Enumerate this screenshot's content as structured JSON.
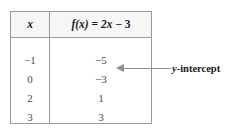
{
  "table": {
    "headers": {
      "variable": "x",
      "function_prefix": "f",
      "function_arg": "(x)",
      "function_equals": "=",
      "function_term": "2x",
      "function_minus": "−",
      "function_constant": "3",
      "function_full": "f(x) = 2x − 3"
    },
    "rows": [
      {
        "x": "−1",
        "fx": "−5"
      },
      {
        "x": "0",
        "fx": "−3"
      },
      {
        "x": "2",
        "fx": "1"
      },
      {
        "x": "3",
        "fx": "3"
      }
    ]
  },
  "annotation": {
    "label_italic": "y",
    "label_rest": "-intercept",
    "label_full": "y-intercept",
    "points_to_row_index": 1,
    "arrow_direction": "left"
  },
  "colors": {
    "border": "#9a9a9a",
    "header_fill": "#f6f6f6",
    "header_text": "#1b1b1b",
    "body_text": "#4a4a4a",
    "annotation_line": "#8e8e8e",
    "annotation_text": "#1b1b1b",
    "background": "#ffffff"
  }
}
